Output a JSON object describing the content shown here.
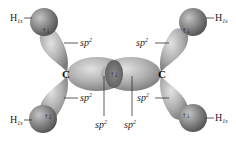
{
  "diagram": {
    "atoms": {
      "carbon_left": "C",
      "carbon_right": "C"
    },
    "hydrogen_labels": {
      "top_left": {
        "main": "H",
        "sub": "1s"
      },
      "top_right": {
        "main": "H",
        "sub": "1s"
      },
      "bottom_left": {
        "main": "H",
        "sub": "1s"
      },
      "bottom_right": {
        "main": "H",
        "sub": "1s"
      }
    },
    "orbital_labels": {
      "upper_left": {
        "main": "sp",
        "sup": "2"
      },
      "upper_right": {
        "main": "sp",
        "sup": "2"
      },
      "lower_left": {
        "main": "sp",
        "sup": "2"
      },
      "lower_right": {
        "main": "sp",
        "sup": "2"
      },
      "center_left": {
        "main": "sp",
        "sup": "2"
      },
      "center_right": {
        "main": "sp",
        "sup": "2"
      }
    },
    "electron_pair_symbol": "↑↓",
    "colors": {
      "lobe": "#9a9a9a",
      "lobe_highlight": "#dcdcdc",
      "hydrogen": "#6d6d6d",
      "hydrogen_highlight": "#bdbdbd",
      "text": "#222222"
    }
  }
}
